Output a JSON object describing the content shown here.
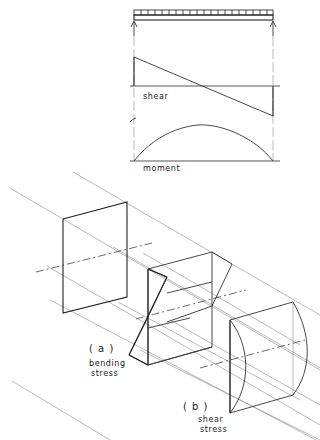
{
  "figure": {
    "top_diagrams": {
      "beam": {
        "load": "uniformly-distributed-load",
        "supports": [
          "left-reaction-arrow",
          "right-reaction-arrow"
        ]
      },
      "shear_label": "shear",
      "moment_label": "moment"
    },
    "sections": {
      "a_label": "( a )",
      "a_caption_line1": "bending",
      "a_caption_line2": "stress",
      "b_label": "( b )",
      "b_caption_line1": "shear",
      "b_caption_line2": "stress"
    }
  }
}
